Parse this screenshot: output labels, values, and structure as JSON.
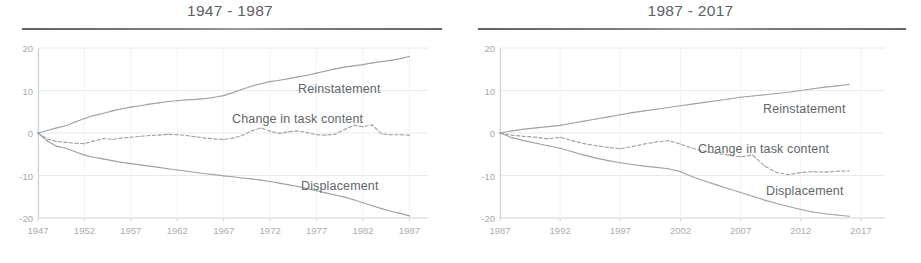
{
  "figure": {
    "panels": [
      {
        "id": "left",
        "title": "1947 - 1987",
        "y_ticks": [
          "20",
          "10",
          "0",
          "-10",
          "-20"
        ],
        "x_ticks": [
          "1947",
          "1952",
          "1957",
          "1962",
          "1967",
          "1972",
          "1977",
          "1982",
          "1987"
        ],
        "series_labels": {
          "reinstatement": "Reinstatement",
          "task_content": "Change in task content",
          "displacement": "Displacement"
        }
      },
      {
        "id": "right",
        "title": "1987 - 2017",
        "y_ticks": [
          "20",
          "10",
          "0",
          "-10",
          "-20"
        ],
        "x_ticks": [
          "1987",
          "1992",
          "1997",
          "2002",
          "2007",
          "2012",
          "2017"
        ],
        "series_labels": {
          "reinstatement": "Reinstatement",
          "task_content": "Change in task content",
          "displacement": "Displacement"
        }
      }
    ]
  },
  "colors": {
    "line": "#9ea3a7",
    "axis": "#cfd3d6",
    "grid": "#e7eaec",
    "tick_text": "#a8adb0",
    "label_text": "#62666a",
    "title_text": "#5d6164",
    "rule": "#52565a",
    "background": "#ffffff"
  },
  "chart_data": [
    {
      "type": "line",
      "title": "1947 - 1987",
      "xlabel": "",
      "ylabel": "",
      "xlim": [
        1947,
        1989
      ],
      "ylim": [
        -20,
        20
      ],
      "grid": true,
      "legend_position": "inline-right",
      "xticks": [
        1947,
        1952,
        1957,
        1962,
        1967,
        1972,
        1977,
        1982,
        1987
      ],
      "yticks": [
        -20,
        -10,
        0,
        10,
        20
      ],
      "x": [
        1947,
        1948,
        1949,
        1950,
        1951,
        1952,
        1953,
        1954,
        1955,
        1956,
        1957,
        1958,
        1959,
        1960,
        1961,
        1962,
        1963,
        1964,
        1965,
        1966,
        1967,
        1968,
        1969,
        1970,
        1971,
        1972,
        1973,
        1974,
        1975,
        1976,
        1977,
        1978,
        1979,
        1980,
        1981,
        1982,
        1983,
        1984,
        1985,
        1986,
        1987
      ],
      "series": [
        {
          "name": "Reinstatement",
          "style": "solid",
          "values": [
            0.0,
            0.6,
            1.2,
            1.7,
            2.6,
            3.4,
            4.1,
            4.6,
            5.2,
            5.7,
            6.1,
            6.4,
            6.8,
            7.1,
            7.4,
            7.6,
            7.8,
            7.9,
            8.1,
            8.4,
            8.8,
            9.5,
            10.3,
            11.0,
            11.6,
            12.1,
            12.4,
            12.8,
            13.2,
            13.6,
            14.1,
            14.6,
            15.1,
            15.5,
            15.8,
            16.1,
            16.5,
            16.8,
            17.1,
            17.5,
            18.0
          ]
        },
        {
          "name": "Change in task content",
          "style": "dashed",
          "values": [
            0.0,
            -1.4,
            -2.0,
            -2.2,
            -2.4,
            -2.5,
            -1.9,
            -1.3,
            -1.5,
            -1.2,
            -1.0,
            -0.8,
            -0.6,
            -0.5,
            -0.3,
            -0.4,
            -0.6,
            -0.9,
            -1.2,
            -1.4,
            -1.5,
            -1.2,
            -0.6,
            0.5,
            1.2,
            0.4,
            -0.1,
            0.3,
            0.5,
            0.1,
            -0.4,
            -0.5,
            -0.3,
            0.8,
            1.8,
            1.5,
            1.9,
            -0.2,
            -0.4,
            -0.4,
            -0.5
          ]
        },
        {
          "name": "Displacement",
          "style": "solid",
          "values": [
            0.0,
            -1.9,
            -3.1,
            -3.6,
            -4.4,
            -5.2,
            -5.7,
            -6.1,
            -6.5,
            -6.9,
            -7.2,
            -7.5,
            -7.8,
            -8.1,
            -8.4,
            -8.7,
            -9.0,
            -9.3,
            -9.6,
            -9.8,
            -10.1,
            -10.3,
            -10.6,
            -10.8,
            -11.1,
            -11.4,
            -11.8,
            -12.2,
            -12.6,
            -13.1,
            -13.6,
            -14.1,
            -14.6,
            -15.1,
            -15.7,
            -16.4,
            -17.1,
            -17.8,
            -18.4,
            -18.9,
            -19.5
          ]
        }
      ]
    },
    {
      "type": "line",
      "title": "1987 - 2017",
      "xlabel": "",
      "ylabel": "",
      "xlim": [
        1987,
        2019
      ],
      "ylim": [
        -20,
        20
      ],
      "grid": true,
      "legend_position": "inline-right",
      "xticks": [
        1987,
        1992,
        1997,
        2002,
        2007,
        2012,
        2017
      ],
      "yticks": [
        -20,
        -10,
        0,
        10,
        20
      ],
      "x": [
        1987,
        1988,
        1989,
        1990,
        1991,
        1992,
        1993,
        1994,
        1995,
        1996,
        1997,
        1998,
        1999,
        2000,
        2001,
        2002,
        2003,
        2004,
        2005,
        2006,
        2007,
        2008,
        2009,
        2010,
        2011,
        2012,
        2013,
        2014,
        2015,
        2016
      ],
      "series": [
        {
          "name": "Reinstatement",
          "style": "solid",
          "values": [
            0.0,
            0.5,
            0.9,
            1.2,
            1.5,
            1.8,
            2.3,
            2.8,
            3.3,
            3.8,
            4.3,
            4.8,
            5.2,
            5.6,
            6.0,
            6.4,
            6.8,
            7.2,
            7.6,
            8.0,
            8.4,
            8.7,
            9.0,
            9.3,
            9.6,
            10.0,
            10.4,
            10.8,
            11.1,
            11.4
          ]
        },
        {
          "name": "Change in task content",
          "style": "dashed",
          "values": [
            0.0,
            -0.5,
            -0.8,
            -1.0,
            -1.4,
            -1.0,
            -1.8,
            -2.5,
            -3.0,
            -3.4,
            -3.7,
            -3.2,
            -2.6,
            -2.1,
            -1.8,
            -2.6,
            -3.6,
            -4.3,
            -4.8,
            -5.2,
            -5.6,
            -5.2,
            -7.8,
            -9.3,
            -9.8,
            -9.3,
            -9.1,
            -9.2,
            -9.0,
            -8.9
          ]
        },
        {
          "name": "Displacement",
          "style": "solid",
          "values": [
            0.0,
            -1.1,
            -1.8,
            -2.4,
            -3.0,
            -3.6,
            -4.4,
            -5.2,
            -5.9,
            -6.5,
            -7.0,
            -7.4,
            -7.8,
            -8.1,
            -8.4,
            -9.1,
            -10.3,
            -11.3,
            -12.2,
            -13.1,
            -14.0,
            -14.9,
            -15.8,
            -16.6,
            -17.3,
            -18.0,
            -18.6,
            -19.0,
            -19.3,
            -19.6
          ]
        }
      ]
    }
  ]
}
